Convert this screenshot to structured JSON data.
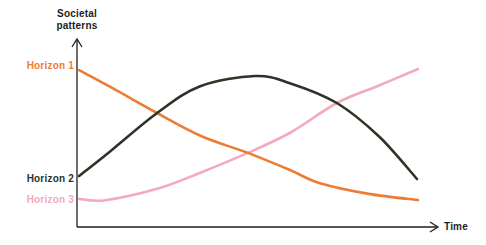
{
  "canvas": {
    "width": 486,
    "height": 245,
    "background": "#ffffff"
  },
  "labels": {
    "y_axis": "Societal\npatterns",
    "x_axis": "Time",
    "series": [
      {
        "id": "horizon-1",
        "text": "Horizon 1",
        "color": "#ED7C33"
      },
      {
        "id": "horizon-2",
        "text": "Horizon 2",
        "color": "#2A3527"
      },
      {
        "id": "horizon-3",
        "text": "Horizon 3",
        "color": "#F3A9BF"
      }
    ]
  },
  "style": {
    "axis_color": "#1E1E1E",
    "text_color": "#1E1E1E",
    "curve_width": 2.6,
    "axis_width": 1.3
  },
  "chart_data": {
    "type": "line",
    "title": "",
    "xlabel": "Time",
    "ylabel": "Societal patterns",
    "legend_position": "left-margin labels aligned to curve start points",
    "grid": false,
    "ticks": "none (qualitative axes with arrowheads)",
    "x_range": [
      0,
      100
    ],
    "y_range": [
      0,
      100
    ],
    "draw_order": [
      "Horizon 3",
      "Horizon 1",
      "Horizon 2"
    ],
    "series": [
      {
        "name": "Horizon 1",
        "id": "horizon-1",
        "color": "#ED7C33",
        "shape": "convex declining curve, steep at start then flattening",
        "points": [
          [
            0.6,
            83
          ],
          [
            10,
            73.5
          ],
          [
            22.5,
            60.3
          ],
          [
            35,
            48
          ],
          [
            48,
            39.2
          ],
          [
            60,
            30
          ],
          [
            68,
            23.3
          ],
          [
            82,
            17.5
          ],
          [
            95.8,
            14.3
          ]
        ]
      },
      {
        "name": "Horizon 2",
        "id": "horizon-2",
        "color": "#2A3527",
        "shape": "bell curve peaking mid-timeline",
        "points": [
          [
            0.6,
            27
          ],
          [
            9.3,
            40
          ],
          [
            22.5,
            60.3
          ],
          [
            34.6,
            74.5
          ],
          [
            50,
            79.9
          ],
          [
            60,
            76
          ],
          [
            73,
            65.6
          ],
          [
            85,
            47.6
          ],
          [
            95.5,
            25.4
          ]
        ]
      },
      {
        "name": "Horizon 3",
        "id": "horizon-3",
        "color": "#F3A9BF",
        "shape": "near-flat start rising with increasing slope",
        "points": [
          [
            0.6,
            14.8
          ],
          [
            8,
            14.2
          ],
          [
            23,
            20.5
          ],
          [
            35,
            29
          ],
          [
            48,
            39.2
          ],
          [
            60,
            50
          ],
          [
            73,
            65.6
          ],
          [
            85,
            75
          ],
          [
            95.8,
            83.6
          ]
        ]
      }
    ],
    "crossings_note": "H1 crosses H2 at ~22% time, H1 crosses H3 at ~48% time, H2 crosses H3 at ~73% time"
  }
}
